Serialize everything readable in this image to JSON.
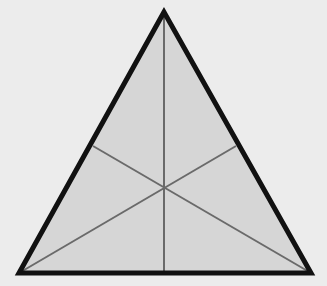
{
  "diagram": {
    "type": "triangle-medians",
    "colors": {
      "background": "#ececec",
      "fill": "#d6d6d6",
      "outline": "#111111",
      "median": "#6a6a6a"
    },
    "vertices": {
      "top": [
        164,
        12
      ],
      "bottom_left": [
        19,
        273
      ],
      "bottom_right": [
        311,
        273
      ]
    },
    "midpoints": {
      "left_side": [
        93,
        146
      ],
      "right_side": [
        236,
        146
      ],
      "base": [
        164,
        273
      ]
    },
    "centroid": [
      164,
      187
    ],
    "outline_width": 5,
    "median_width": 2
  }
}
